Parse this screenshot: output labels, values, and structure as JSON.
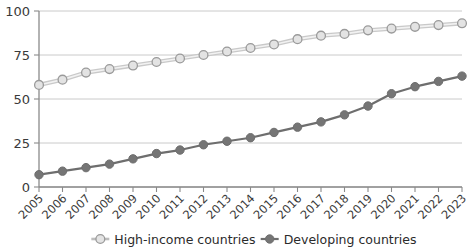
{
  "chart_data": {
    "type": "line",
    "title": "",
    "subtitle": "",
    "xlabel": "",
    "ylabel": "",
    "ylim": [
      0,
      100
    ],
    "yticks": [
      0,
      25,
      50,
      75,
      100
    ],
    "grid": true,
    "legend_position": "bottom",
    "categories": [
      "2005",
      "2006",
      "2007",
      "2008",
      "2009",
      "2010",
      "2011",
      "2012",
      "2013",
      "2014",
      "2015",
      "2016",
      "2017",
      "2018",
      "2019",
      "2020",
      "2021",
      "2022",
      "2023"
    ],
    "series": [
      {
        "name": "High-income countries",
        "marker": "open-circle",
        "color": "#9a9a9a",
        "fill": "#e3e3e3",
        "values": [
          58,
          61,
          65,
          67,
          69,
          71,
          73,
          75,
          77,
          79,
          81,
          84,
          86,
          87,
          89,
          90,
          91,
          92,
          93
        ]
      },
      {
        "name": "Developing countries",
        "marker": "filled-circle",
        "color": "#6e6e6e",
        "fill": "#757575",
        "values": [
          7,
          9,
          11,
          13,
          16,
          19,
          21,
          24,
          26,
          28,
          31,
          34,
          37,
          41,
          46,
          53,
          57,
          60,
          63
        ]
      }
    ]
  },
  "legend": {
    "items": [
      {
        "label": "High-income countries",
        "marker": "open-circle"
      },
      {
        "label": "Developing countries",
        "marker": "filled-circle"
      }
    ]
  },
  "colors": {
    "high_income_stroke": "#9a9a9a",
    "high_income_fill": "#e3e3e3",
    "developing_stroke": "#6e6e6e",
    "developing_fill": "#757575",
    "grid": "#bdbdbd",
    "axis": "#8a8a8a",
    "text": "#2b2b2b"
  }
}
